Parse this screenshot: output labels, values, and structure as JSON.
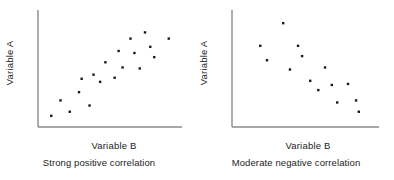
{
  "figure": {
    "title": "",
    "background_color": "#ffffff",
    "axis_color": "#8a8a8a",
    "dot_color": "#1a1a1a",
    "text_color": "#1c1c1c"
  },
  "chart_data": [
    {
      "type": "scatter",
      "id": "strong-positive",
      "title": "",
      "caption": "Strong positive correlation",
      "xlabel": "Variable B",
      "ylabel": "Variable A",
      "xlim": [
        0,
        100
      ],
      "ylim": [
        0,
        100
      ],
      "grid": false,
      "legend": null,
      "xticks": [],
      "yticks": [],
      "marker": "square",
      "marker_size": 2.4,
      "points": [
        {
          "x": 4,
          "y": 5
        },
        {
          "x": 11,
          "y": 20
        },
        {
          "x": 18,
          "y": 9
        },
        {
          "x": 25,
          "y": 28
        },
        {
          "x": 27,
          "y": 41
        },
        {
          "x": 33,
          "y": 15
        },
        {
          "x": 36,
          "y": 45
        },
        {
          "x": 41,
          "y": 38
        },
        {
          "x": 45,
          "y": 57
        },
        {
          "x": 52,
          "y": 42
        },
        {
          "x": 55,
          "y": 68
        },
        {
          "x": 58,
          "y": 52
        },
        {
          "x": 64,
          "y": 80
        },
        {
          "x": 67,
          "y": 66
        },
        {
          "x": 71,
          "y": 51
        },
        {
          "x": 75,
          "y": 86
        },
        {
          "x": 79,
          "y": 72
        },
        {
          "x": 82,
          "y": 62
        },
        {
          "x": 93,
          "y": 80
        }
      ]
    },
    {
      "type": "scatter",
      "id": "moderate-negative",
      "title": "",
      "caption": "Moderate negative correlation",
      "xlabel": "Variable B",
      "ylabel": "Variable A",
      "xlim": [
        0,
        100
      ],
      "ylim": [
        0,
        100
      ],
      "grid": false,
      "legend": null,
      "xticks": [],
      "yticks": [],
      "marker": "square",
      "marker_size": 2.4,
      "points": [
        {
          "x": 15,
          "y": 73
        },
        {
          "x": 20,
          "y": 59
        },
        {
          "x": 32,
          "y": 95
        },
        {
          "x": 37,
          "y": 50
        },
        {
          "x": 43,
          "y": 73
        },
        {
          "x": 46,
          "y": 63
        },
        {
          "x": 52,
          "y": 39
        },
        {
          "x": 58,
          "y": 30
        },
        {
          "x": 63,
          "y": 52
        },
        {
          "x": 68,
          "y": 35
        },
        {
          "x": 72,
          "y": 18
        },
        {
          "x": 80,
          "y": 36
        },
        {
          "x": 86,
          "y": 20
        },
        {
          "x": 88,
          "y": 9
        }
      ]
    }
  ]
}
